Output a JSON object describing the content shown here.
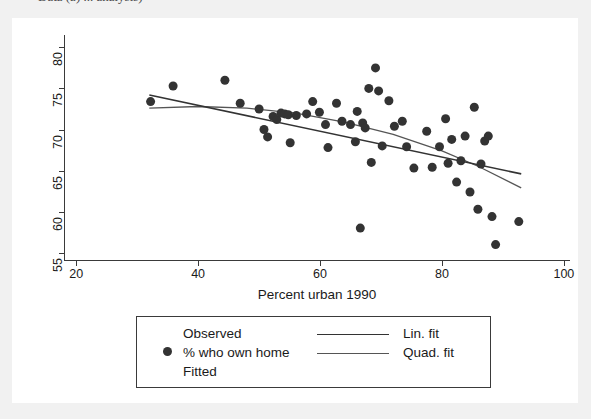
{
  "caption": {
    "text": "Data (a)  ...  analysis)"
  },
  "chart_data": {
    "type": "scatter",
    "title": "",
    "xlabel": "Percent urban 1990",
    "ylabel": "",
    "xlim": [
      18,
      101
    ],
    "ylim": [
      54,
      81.5
    ],
    "xticks": [
      20,
      40,
      60,
      80,
      100
    ],
    "yticks": [
      55,
      60,
      65,
      70,
      75,
      80
    ],
    "grid": false,
    "marker": {
      "shape": "circle",
      "color": "#333333",
      "size": 9
    },
    "legend": {
      "position": "below-plot",
      "col1_header": "Observed",
      "col1_entry": "% who own home",
      "col1_footer": "Fitted",
      "entries": [
        {
          "label": "Lin. fit",
          "style": "line",
          "color": "#333333"
        },
        {
          "label": "Quad. fit",
          "style": "line",
          "color": "#555555"
        }
      ]
    },
    "points": [
      {
        "x": 32.2,
        "y": 73.4
      },
      {
        "x": 35.9,
        "y": 75.3
      },
      {
        "x": 44.4,
        "y": 76.0
      },
      {
        "x": 46.9,
        "y": 73.2
      },
      {
        "x": 50.0,
        "y": 72.5
      },
      {
        "x": 50.8,
        "y": 70.0
      },
      {
        "x": 51.4,
        "y": 69.1
      },
      {
        "x": 52.3,
        "y": 71.6
      },
      {
        "x": 52.9,
        "y": 71.2
      },
      {
        "x": 53.6,
        "y": 72.0
      },
      {
        "x": 54.2,
        "y": 71.9
      },
      {
        "x": 54.8,
        "y": 71.8
      },
      {
        "x": 55.1,
        "y": 68.4
      },
      {
        "x": 56.1,
        "y": 71.7
      },
      {
        "x": 57.8,
        "y": 71.9
      },
      {
        "x": 58.8,
        "y": 73.4
      },
      {
        "x": 59.9,
        "y": 72.1
      },
      {
        "x": 60.9,
        "y": 70.6
      },
      {
        "x": 61.3,
        "y": 67.8
      },
      {
        "x": 62.7,
        "y": 73.2
      },
      {
        "x": 63.6,
        "y": 71.0
      },
      {
        "x": 65.0,
        "y": 70.6
      },
      {
        "x": 65.8,
        "y": 68.5
      },
      {
        "x": 66.1,
        "y": 72.2
      },
      {
        "x": 66.6,
        "y": 58.0
      },
      {
        "x": 67.0,
        "y": 70.8
      },
      {
        "x": 67.4,
        "y": 70.2
      },
      {
        "x": 68.0,
        "y": 75.0
      },
      {
        "x": 68.4,
        "y": 66.0
      },
      {
        "x": 69.1,
        "y": 77.5
      },
      {
        "x": 69.6,
        "y": 74.7
      },
      {
        "x": 70.2,
        "y": 68.0
      },
      {
        "x": 71.3,
        "y": 73.5
      },
      {
        "x": 72.2,
        "y": 70.4
      },
      {
        "x": 73.5,
        "y": 71.0
      },
      {
        "x": 74.2,
        "y": 67.9
      },
      {
        "x": 75.4,
        "y": 65.3
      },
      {
        "x": 77.5,
        "y": 69.8
      },
      {
        "x": 78.4,
        "y": 65.4
      },
      {
        "x": 79.6,
        "y": 67.9
      },
      {
        "x": 80.6,
        "y": 71.3
      },
      {
        "x": 81.0,
        "y": 65.9
      },
      {
        "x": 81.6,
        "y": 68.8
      },
      {
        "x": 82.4,
        "y": 63.6
      },
      {
        "x": 83.1,
        "y": 66.2
      },
      {
        "x": 83.8,
        "y": 69.2
      },
      {
        "x": 84.6,
        "y": 62.4
      },
      {
        "x": 85.3,
        "y": 72.7
      },
      {
        "x": 85.9,
        "y": 60.3
      },
      {
        "x": 86.4,
        "y": 65.8
      },
      {
        "x": 87.0,
        "y": 68.6
      },
      {
        "x": 87.6,
        "y": 69.2
      },
      {
        "x": 88.2,
        "y": 59.4
      },
      {
        "x": 88.8,
        "y": 56.0
      },
      {
        "x": 92.6,
        "y": 58.8
      }
    ],
    "lin_fit": {
      "label": "Lin. fit",
      "x0": 32.0,
      "y0": 74.2,
      "x1": 93.0,
      "y1": 64.6
    },
    "quad_fit": {
      "label": "Quad. fit",
      "points": [
        {
          "x": 32.0,
          "y": 72.6
        },
        {
          "x": 40.0,
          "y": 72.8
        },
        {
          "x": 48.0,
          "y": 72.6
        },
        {
          "x": 56.0,
          "y": 72.0
        },
        {
          "x": 64.0,
          "y": 70.9
        },
        {
          "x": 72.0,
          "y": 69.4
        },
        {
          "x": 80.0,
          "y": 67.4
        },
        {
          "x": 86.0,
          "y": 65.5
        },
        {
          "x": 93.0,
          "y": 62.9
        }
      ]
    }
  }
}
